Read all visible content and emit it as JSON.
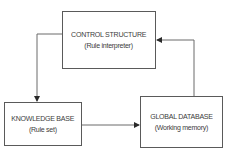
{
  "diagram": {
    "nodes": [
      {
        "id": "control",
        "title": "CONTROL STRUCTURE",
        "subtitle": "(Rule interpreter)"
      },
      {
        "id": "knowledge",
        "title": "KNOWLEDGE BASE",
        "subtitle": "(Rule set)"
      },
      {
        "id": "global",
        "title": "GLOBAL DATABASE",
        "subtitle": "(Working memory)"
      }
    ],
    "edges": [
      {
        "from": "control",
        "to": "knowledge"
      },
      {
        "from": "knowledge",
        "to": "global"
      },
      {
        "from": "global",
        "to": "control"
      }
    ],
    "colors": {
      "line": "#5a5a5a",
      "text": "#3c3c3c",
      "background": "#ffffff"
    }
  }
}
